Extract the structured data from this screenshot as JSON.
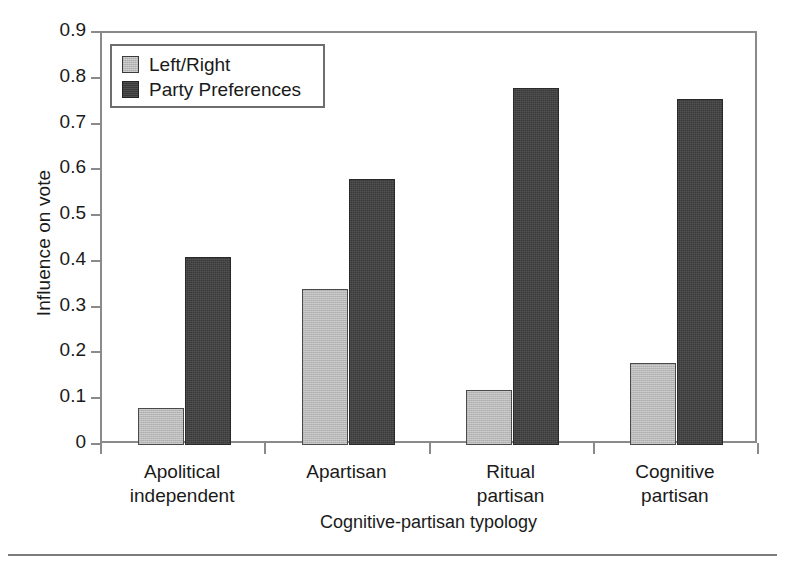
{
  "chart_data": {
    "type": "bar",
    "title": "",
    "xlabel": "Cognitive-partisan typology",
    "ylabel": "Influence on vote",
    "categories": [
      "Apolitical independent",
      "Apartisan",
      "Ritual partisan",
      "Cognitive partisan"
    ],
    "category_lines": [
      [
        "Apolitical",
        "independent"
      ],
      [
        "Apartisan",
        ""
      ],
      [
        "Ritual",
        "partisan"
      ],
      [
        "Cognitive",
        "partisan"
      ]
    ],
    "series": [
      {
        "name": "Left/Right",
        "color": "#b8b8b8",
        "values": [
          0.08,
          0.34,
          0.12,
          0.18
        ]
      },
      {
        "name": "Party Preferences",
        "color": "#3a3a3a",
        "values": [
          0.41,
          0.58,
          0.78,
          0.755
        ]
      }
    ],
    "ylim": [
      0,
      0.9
    ],
    "ytick_labels": [
      "0.9",
      "0.8",
      "0.7",
      "0.6",
      "0.5",
      "0.4",
      "0.3",
      "0.2",
      "0.1",
      "0"
    ],
    "ytick_values": [
      0.9,
      0.8,
      0.7,
      0.6,
      0.5,
      0.4,
      0.3,
      0.2,
      0.1,
      0
    ],
    "grid": false,
    "legend_position": "top-left"
  },
  "legend": {
    "entries": [
      {
        "label": "Left/Right"
      },
      {
        "label": "Party Preferences"
      }
    ]
  }
}
